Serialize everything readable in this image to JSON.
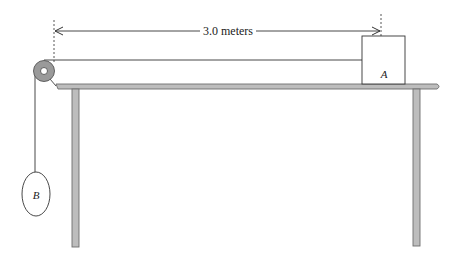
{
  "diagram": {
    "type": "physics-pulley-table",
    "distance_label": "3.0 meters",
    "block_a_label": "A",
    "mass_b_label": "B",
    "colors": {
      "line": "#333333",
      "table_fill": "#bdbdbd",
      "table_stroke": "#6e6e6e",
      "pulley_fill": "#9a9a9a",
      "background": "#ffffff"
    }
  }
}
